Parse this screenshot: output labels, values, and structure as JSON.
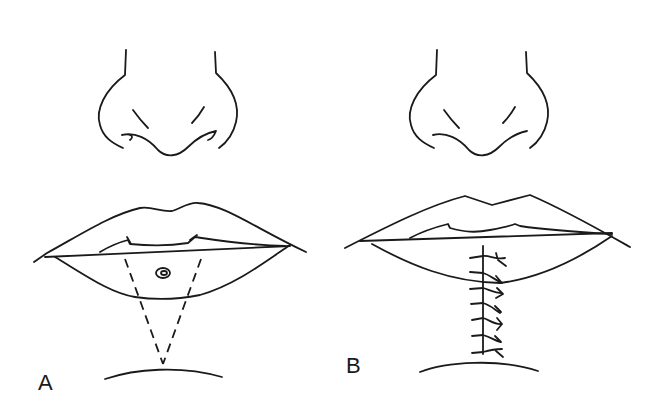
{
  "figure": {
    "panels": [
      {
        "label": "A",
        "description": "Lower lip lesion with V-shaped (wedge) excision outlined by dashed lines"
      },
      {
        "label": "B",
        "description": "Closure of wedge excision with vertical sutures"
      }
    ]
  }
}
